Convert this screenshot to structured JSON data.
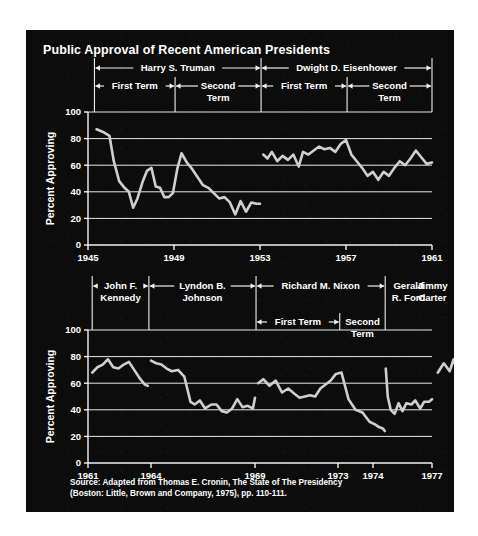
{
  "title": "Public Approval of Recent American Presidents",
  "source": "Source: Adapted from Thomas E. Cronin, The State of The Presidency\n(Boston: Little, Brown and Company, 1975), pp. 110-111.",
  "panel": {
    "background_color": "#0d0c0c",
    "line_color": "#cfcfcf",
    "grid_color": "#e8e8e8",
    "text_color": "#ffffff"
  },
  "chart_data": [
    {
      "type": "line",
      "id": "chart-truman-eisenhower",
      "title": "Public Approval of Recent American Presidents",
      "xlabel": "",
      "ylabel": "Percent Approving",
      "xlim": [
        1945,
        1961
      ],
      "ylim": [
        0,
        100
      ],
      "yticks": [
        0,
        20,
        40,
        60,
        80,
        100
      ],
      "xticks": [
        1945,
        1949,
        1953,
        1957,
        1961
      ],
      "xtick_labels": [
        "1945",
        "1949",
        "1953",
        "1957",
        "1961"
      ],
      "ytick_labels": [
        "0",
        "20",
        "40",
        "60",
        "80",
        "100"
      ],
      "grid": true,
      "legend": "none",
      "administrations": [
        {
          "name": "Harry S. Truman",
          "start": 1945.3,
          "end": 1953.05,
          "terms": [
            {
              "label": "First Term",
              "start": 1945.3,
              "end": 1949.05
            },
            {
              "label": "Second\nTerm",
              "start": 1949.05,
              "end": 1953.05
            }
          ]
        },
        {
          "name": "Dwight D. Eisenhower",
          "start": 1953.05,
          "end": 1961.0,
          "terms": [
            {
              "label": "First Term",
              "start": 1953.05,
              "end": 1957.05
            },
            {
              "label": "Second\nTerm",
              "start": 1957.05,
              "end": 1961.0
            }
          ]
        }
      ],
      "series": [
        {
          "name": "Truman approval",
          "x": [
            1945.4,
            1945.7,
            1946.0,
            1946.2,
            1946.45,
            1946.7,
            1946.9,
            1947.1,
            1947.3,
            1947.55,
            1947.75,
            1947.95,
            1948.15,
            1948.35,
            1948.55,
            1948.75,
            1948.95,
            1949.15,
            1949.35,
            1949.6,
            1949.85,
            1950.1,
            1950.35,
            1950.6,
            1950.85,
            1951.1,
            1951.35,
            1951.6,
            1951.85,
            1952.1,
            1952.35,
            1952.6,
            1952.85,
            1953.0
          ],
          "y": [
            87,
            85,
            82,
            63,
            48,
            43,
            40,
            28,
            35,
            48,
            56,
            58,
            44,
            43,
            36,
            36,
            39,
            57,
            69,
            62,
            57,
            51,
            45,
            43,
            39,
            35,
            36,
            32,
            23,
            33,
            25,
            32,
            31,
            31
          ]
        },
        {
          "name": "Eisenhower approval",
          "x": [
            1953.15,
            1953.35,
            1953.55,
            1953.8,
            1954.05,
            1954.3,
            1954.55,
            1954.8,
            1955.0,
            1955.25,
            1955.5,
            1955.75,
            1956.0,
            1956.25,
            1956.5,
            1956.75,
            1957.0,
            1957.25,
            1957.5,
            1957.75,
            1958.0,
            1958.25,
            1958.5,
            1958.75,
            1959.0,
            1959.25,
            1959.5,
            1959.75,
            1960.0,
            1960.25,
            1960.5,
            1960.75,
            1961.0
          ],
          "y": [
            68,
            65,
            70,
            63,
            67,
            64,
            68,
            59,
            70,
            68,
            71,
            74,
            72,
            73,
            70,
            76,
            79,
            68,
            63,
            58,
            52,
            55,
            49,
            55,
            52,
            58,
            63,
            60,
            65,
            71,
            66,
            61,
            62
          ]
        }
      ]
    },
    {
      "type": "line",
      "id": "chart-kennedy-carter",
      "title": "",
      "xlabel": "",
      "ylabel": "Percent Approving",
      "xlim": [
        1961,
        1978.6
      ],
      "ylim": [
        0,
        100
      ],
      "yticks": [
        0,
        20,
        40,
        60,
        80,
        100
      ],
      "xticks": [
        1961,
        1964,
        1969,
        1973,
        1974,
        1977
      ],
      "xtick_labels": [
        "1961",
        "1964",
        "1969",
        "1973",
        "1974",
        "1977"
      ],
      "ytick_labels": [
        "0",
        "20",
        "40",
        "60",
        "80",
        "100"
      ],
      "grid": true,
      "legend": "none",
      "administrations": [
        {
          "name": "John F.\nKennedy",
          "start": 1961.2,
          "end": 1963.9,
          "terms": []
        },
        {
          "name": "Lyndon B.\nJohnson",
          "start": 1963.9,
          "end": 1969.05,
          "terms": []
        },
        {
          "name": "Richard M. Nixon",
          "start": 1969.05,
          "end": 1974.62,
          "terms": [
            {
              "label": "First Term",
              "start": 1969.05,
              "end": 1973.05
            },
            {
              "label": "Second\nTerm",
              "start": 1973.05,
              "end": 1974.62
            }
          ]
        },
        {
          "name": "Gerald\nR. Ford",
          "start": 1974.62,
          "end": 1977.05,
          "terms": []
        },
        {
          "name": "Jimmy\nCarter",
          "start": 1977.05,
          "end": 1978.6,
          "terms": []
        }
      ],
      "series": [
        {
          "name": "Kennedy approval",
          "x": [
            1961.2,
            1961.45,
            1961.7,
            1961.95,
            1962.2,
            1962.45,
            1962.7,
            1962.95,
            1963.2,
            1963.45,
            1963.7,
            1963.85
          ],
          "y": [
            68,
            72,
            74,
            78,
            72,
            71,
            74,
            76,
            70,
            64,
            59,
            58
          ]
        },
        {
          "name": "Johnson approval",
          "x": [
            1964.0,
            1964.25,
            1964.5,
            1964.75,
            1965.0,
            1965.3,
            1965.6,
            1965.9,
            1966.1,
            1966.35,
            1966.6,
            1966.9,
            1967.15,
            1967.4,
            1967.65,
            1967.9,
            1968.15,
            1968.4,
            1968.65,
            1968.9,
            1969.0
          ],
          "y": [
            77,
            75,
            74,
            71,
            69,
            70,
            65,
            46,
            44,
            47,
            41,
            44,
            44,
            39,
            38,
            41,
            48,
            42,
            43,
            41,
            49
          ]
        },
        {
          "name": "Nixon approval",
          "x": [
            1969.15,
            1969.4,
            1969.7,
            1970.0,
            1970.3,
            1970.6,
            1970.9,
            1971.15,
            1971.4,
            1971.65,
            1971.9,
            1972.15,
            1972.4,
            1972.65,
            1972.9,
            1973.1,
            1973.3,
            1973.5,
            1973.7,
            1973.9,
            1974.1,
            1974.3,
            1974.5,
            1974.6
          ],
          "y": [
            60,
            63,
            58,
            62,
            53,
            56,
            52,
            49,
            50,
            51,
            50,
            56,
            59,
            62,
            67,
            68,
            48,
            40,
            38,
            31,
            29,
            27,
            26,
            24
          ]
        },
        {
          "name": "Ford approval",
          "x": [
            1974.65,
            1974.75,
            1974.9,
            1975.1,
            1975.3,
            1975.5,
            1975.7,
            1975.95,
            1976.15,
            1976.4,
            1976.6,
            1976.85,
            1977.0
          ],
          "y": [
            71,
            50,
            40,
            37,
            45,
            39,
            45,
            44,
            47,
            41,
            46,
            46,
            48
          ]
        },
        {
          "name": "Carter approval",
          "x": [
            1977.3,
            1977.6,
            1977.9,
            1978.1,
            1978.35,
            1978.55
          ],
          "y": [
            68,
            75,
            69,
            78,
            66,
            59
          ]
        }
      ]
    }
  ]
}
